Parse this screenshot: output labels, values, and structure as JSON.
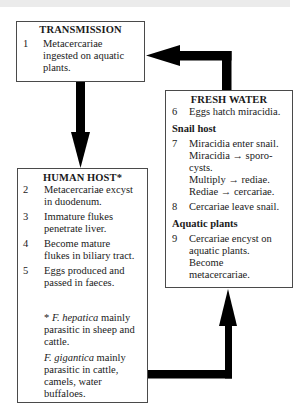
{
  "diagram": {
    "transmission": {
      "title": "TRANSMISSION",
      "items": [
        {
          "num": "1",
          "lines": [
            "Metacercariae",
            "ingested on aquatic",
            "plants."
          ]
        }
      ]
    },
    "fresh_water": {
      "title": "FRESH WATER",
      "items": [
        {
          "num": "6",
          "lines": [
            "Eggs hatch miracidia."
          ]
        }
      ],
      "sections": [
        {
          "heading": "Snail host",
          "items": [
            {
              "num": "7",
              "lines": [
                "Miracidia enter snail.",
                "Miracidia → sporo-",
                "cysts.",
                "Multiply → rediae.",
                "Rediae → cercariae."
              ]
            },
            {
              "num": "8",
              "lines": [
                "Cercariae leave snail."
              ]
            }
          ]
        },
        {
          "heading": "Aquatic plants",
          "items": [
            {
              "num": "9",
              "lines": [
                "Cercariae encyst on",
                "aquatic plants.",
                "Become",
                "metacercariae."
              ]
            }
          ]
        }
      ]
    },
    "human_host": {
      "title": "HUMAN HOST*",
      "items": [
        {
          "num": "2",
          "lines": [
            "Metacercariae excyst",
            "in duodenum."
          ]
        },
        {
          "num": "3",
          "lines": [
            "Immature flukes",
            "penetrate liver."
          ]
        },
        {
          "num": "4",
          "lines": [
            "Become mature",
            "flukes in biliary tract."
          ]
        },
        {
          "num": "5",
          "lines": [
            "Eggs produced and",
            "passed in faeces."
          ]
        }
      ],
      "footnotes": [
        {
          "prefix": "* ",
          "species": "F. hepatica",
          "suffix": " mainly",
          "lines": [
            "parasitic in sheep and",
            "cattle."
          ]
        },
        {
          "prefix": "",
          "species": "F. gigantica",
          "suffix": " mainly",
          "lines": [
            "parasitic in cattle,",
            "camels, water",
            "buffaloes."
          ]
        }
      ]
    },
    "colors": {
      "arrow": "#000000",
      "box_border": "#4a4a4a",
      "top_band": "#ebebeb"
    }
  }
}
